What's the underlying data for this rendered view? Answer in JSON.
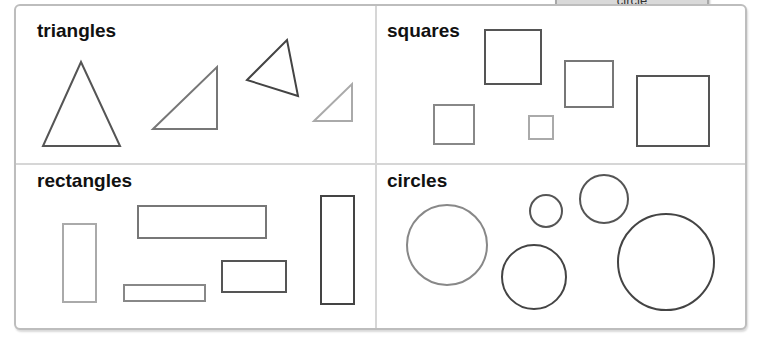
{
  "tab": {
    "label": "circle"
  },
  "panels": [
    {
      "title": "triangles"
    },
    {
      "title": "squares"
    },
    {
      "title": "rectangles"
    },
    {
      "title": "circles"
    }
  ],
  "colors": {
    "dark": "#555555",
    "medium": "#777777",
    "light": "#a8a8a8",
    "border": "#bdbdbd"
  }
}
